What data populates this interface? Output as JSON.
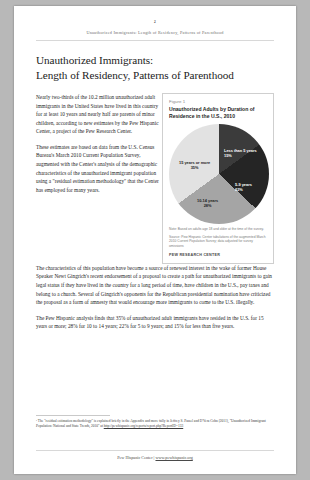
{
  "page": {
    "number": "2",
    "running_head": "Unauthorized Immigrants: Length of Residency, Patterns of Parenthood",
    "title_line1": "Unauthorized Immigrants:",
    "title_line2": "Length of Residency, Patterns of Parenthood"
  },
  "body": {
    "para1": "Nearly two-thirds of the 10.2 million unauthorized adult immigrants in the United States have lived in this country for at least 10 years and nearly half are parents of minor children, according to new estimates by the Pew Hispanic Center, a project of the Pew Research Center.",
    "para2": "These estimates are based on data from the U.S. Census Bureau's March 2010 Current Population Survey, augmented with the Center's analysis of the demographic characteristics of the unauthorized immigrant population using a \"residual estimation methodology\" that the Center has employed for many years.",
    "para3": "The characteristics of this population have become a source of renewed interest in the wake of former House Speaker Newt Gingrich's recent endorsement of a proposal to create a path for unauthorized immigrants to gain legal status if they have lived in the country for a long period of time, have children in the U.S., pay taxes and belong to a church. Several of Gingrich's opponents for the Republican presidential nomination have criticized the proposal as a form of amnesty that would encourage more immigrants to come to the U.S. illegally.",
    "para4": "The Pew Hispanic analysis finds that 35% of unauthorized adult immigrants have resided in the U.S. for 15 years or more; 28% for 10 to 14 years; 22% for 5 to 9 years; and 15% for less than five years."
  },
  "figure": {
    "label": "Figure 1",
    "title_line1": "Unauthorized Adults by Duration of",
    "title_line2": "Residence in the U.S., 2010",
    "note": "Note: Based on adults age 18 and older at the time of the survey.",
    "source": "Source: Pew Hispanic Center tabulations of the augmented March 2010 Current Population Survey; data adjusted for survey omissions",
    "brand": "PEW RESEARCH CENTER",
    "colors": {
      "less_than_5": "#3b3b3b",
      "five_to_nine": "#252525",
      "ten_to_fourteen": "#a5a5a5",
      "fifteen_or_more": "#e2e2e2"
    }
  },
  "chart_data": {
    "type": "pie",
    "title": "Unauthorized Adults by Duration of Residence in the U.S., 2010",
    "categories": [
      "Less than 5 years",
      "5-9 years",
      "10-14 years",
      "15 years or more"
    ],
    "values": [
      15,
      22,
      28,
      35
    ],
    "value_labels": [
      "15%",
      "22%",
      "28%",
      "35%"
    ],
    "unit": "percent",
    "legend": "none",
    "labels_inside": true,
    "start_angle_deg": 0,
    "direction": "clockwise",
    "slice_colors": [
      "#3b3b3b",
      "#252525",
      "#a5a5a5",
      "#e2e2e2"
    ]
  },
  "footnote": {
    "text_part1": "¹ The \"residual estimation methodology\" is explained briefly in the Appendix and more fully in Jeffrey S. Passel and D'Vera Cohn (2011), \"Unauthorized Immigrant Population: National and State Trends, 2010\" at ",
    "url": "http://pewhispanic.org/reports/report.php?ReportID=133"
  },
  "footer": {
    "text": "Pew Hispanic Center | ",
    "link": "www.pewhispanic.org"
  }
}
